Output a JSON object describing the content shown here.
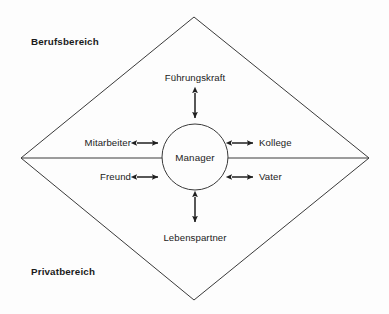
{
  "diagram": {
    "type": "venn-diamond-role-map",
    "background_color": "#fdfdfd",
    "stroke_color": "#3a3a3a",
    "text_color": "#1b1b1b",
    "zones": {
      "top_label": "Berufsbereich",
      "bottom_label": "Privatbereich"
    },
    "center": {
      "label": "Manager"
    },
    "roles": {
      "top": "Führungskraft",
      "bottom": "Lebenspartner",
      "upper_left": "Mitarbeiter",
      "lower_left": "Freund",
      "upper_right": "Kollege",
      "lower_right": "Vater"
    },
    "shapes": {
      "diamond_vertices": [
        {
          "name": "top",
          "x": 194,
          "y": 17
        },
        {
          "name": "right",
          "x": 369,
          "y": 158
        },
        {
          "name": "bottom",
          "x": 194,
          "y": 300
        },
        {
          "name": "left",
          "x": 21,
          "y": 158
        }
      ],
      "divider_line": {
        "x1": 21,
        "y1": 158,
        "x2": 369,
        "y2": 158
      },
      "circle": {
        "cx": 195,
        "cy": 157,
        "r": 33
      }
    },
    "connectors": [
      {
        "name": "connector-fuehrungskraft",
        "orientation": "vertical",
        "x": 195,
        "y1": 92,
        "y2": 119
      },
      {
        "name": "connector-lebenspartner",
        "orientation": "vertical",
        "x": 195,
        "y1": 196,
        "y2": 223
      },
      {
        "name": "connector-mitarbeiter",
        "orientation": "horizontal",
        "y": 143,
        "x1": 136,
        "x2": 159
      },
      {
        "name": "connector-freund",
        "orientation": "horizontal",
        "y": 177,
        "x1": 136,
        "x2": 159
      },
      {
        "name": "connector-kollege",
        "orientation": "horizontal",
        "y": 143,
        "x1": 231,
        "x2": 254
      },
      {
        "name": "connector-vater",
        "orientation": "horizontal",
        "y": 177,
        "x1": 231,
        "x2": 254
      }
    ]
  },
  "labels": {
    "berufsbereich": {
      "x": 31,
      "y": 42
    },
    "privatbereich": {
      "x": 31,
      "y": 272
    },
    "fuehrungskraft": {
      "x": 195,
      "y": 78
    },
    "lebenspartner": {
      "x": 195,
      "y": 238
    },
    "mitarbeiter": {
      "x": 131,
      "y": 143
    },
    "freund": {
      "x": 131,
      "y": 177
    },
    "kollege": {
      "x": 259,
      "y": 143
    },
    "vater": {
      "x": 259,
      "y": 177
    },
    "manager": {
      "x": 195,
      "y": 158
    }
  }
}
